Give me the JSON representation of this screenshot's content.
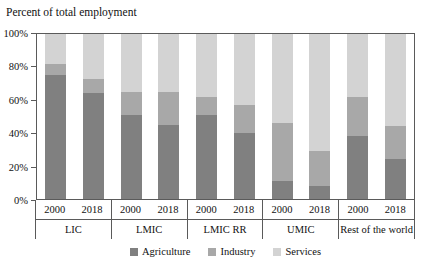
{
  "chart_data": {
    "type": "bar",
    "subtype": "stacked-bar-100-percent",
    "title": "Percent of total employment",
    "xlabel": "",
    "ylabel": "",
    "ylim": [
      0,
      100
    ],
    "ytick_labels": [
      "0%",
      "20%",
      "40%",
      "60%",
      "80%",
      "100%"
    ],
    "ytick_values": [
      0,
      20,
      40,
      60,
      80,
      100
    ],
    "grid": false,
    "legend_position": "bottom-center",
    "categories": [
      "LIC 2000",
      "LIC 2018",
      "LMIC 2000",
      "LMIC 2018",
      "LMIC RR 2000",
      "LMIC RR 2018",
      "UMIC 2000",
      "UMIC 2018",
      "Rest of the world 2000",
      "Rest of the world 2018"
    ],
    "groups": [
      {
        "name": "LIC",
        "bars": [
          {
            "year": "2000",
            "agriculture": 75,
            "industry": 7,
            "services": 18
          },
          {
            "year": "2018",
            "agriculture": 64,
            "industry": 9,
            "services": 27
          }
        ]
      },
      {
        "name": "LMIC",
        "bars": [
          {
            "year": "2000",
            "agriculture": 51,
            "industry": 14,
            "services": 35
          },
          {
            "year": "2018",
            "agriculture": 45,
            "industry": 20,
            "services": 35
          }
        ]
      },
      {
        "name": "LMIC RR",
        "bars": [
          {
            "year": "2000",
            "agriculture": 51,
            "industry": 11,
            "services": 38
          },
          {
            "year": "2018",
            "agriculture": 40,
            "industry": 17,
            "services": 43
          }
        ]
      },
      {
        "name": "UMIC",
        "bars": [
          {
            "year": "2000",
            "agriculture": 11,
            "industry": 35,
            "services": 54
          },
          {
            "year": "2018",
            "agriculture": 8,
            "industry": 21,
            "services": 71
          }
        ]
      },
      {
        "name": "Rest of the world",
        "bars": [
          {
            "year": "2000",
            "agriculture": 38,
            "industry": 24,
            "services": 38
          },
          {
            "year": "2018",
            "agriculture": 24,
            "industry": 20,
            "services": 56
          }
        ]
      }
    ],
    "series": [
      {
        "name": "Agriculture",
        "color": "#808080",
        "values": [
          75,
          64,
          51,
          45,
          51,
          40,
          11,
          8,
          38,
          24
        ]
      },
      {
        "name": "Industry",
        "color": "#a8a8a8",
        "values": [
          7,
          9,
          14,
          20,
          11,
          17,
          35,
          21,
          24,
          20
        ]
      },
      {
        "name": "Services",
        "color": "#d3d3d3",
        "values": [
          18,
          27,
          35,
          35,
          38,
          43,
          54,
          71,
          38,
          56
        ]
      }
    ],
    "legend": [
      {
        "label": "Agriculture",
        "color": "#808080"
      },
      {
        "label": "Industry",
        "color": "#a8a8a8"
      },
      {
        "label": "Services",
        "color": "#d3d3d3"
      }
    ]
  }
}
